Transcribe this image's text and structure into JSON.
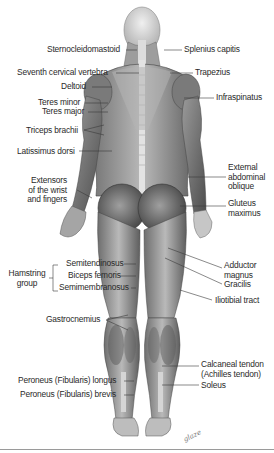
{
  "figure": {
    "view": "posterior",
    "labels_left": [
      {
        "id": "sternocleidomastoid",
        "text": "Sternocleidomastoid",
        "x": 33,
        "y": 46
      },
      {
        "id": "seventh-cervical-vertebra",
        "text": "Seventh cervical vertebra",
        "x": 17,
        "y": 69
      },
      {
        "id": "deltoid",
        "text": "Deltoid",
        "x": 62,
        "y": 83
      },
      {
        "id": "teres-minor",
        "text": "Teres minor",
        "x": 40,
        "y": 99
      },
      {
        "id": "teres-major",
        "text": "Teres major",
        "x": 43,
        "y": 108
      },
      {
        "id": "triceps-brachii",
        "text": "Triceps brachii",
        "x": 26,
        "y": 126
      },
      {
        "id": "latissimus-dorsi",
        "text": "Latissimus dorsi",
        "x": 17,
        "y": 147
      },
      {
        "id": "extensors-wrist-fingers",
        "text": "Extensors\nof the wrist\nand fingers",
        "x": 30,
        "y": 178
      },
      {
        "id": "semitendinosus",
        "text": "Semitendinosus",
        "x": 66,
        "y": 260
      },
      {
        "id": "biceps-femoris",
        "text": "Biceps femoris",
        "x": 68,
        "y": 272
      },
      {
        "id": "semimembranosus",
        "text": "Semimembranosus",
        "x": 58,
        "y": 284
      },
      {
        "id": "hamstring-group",
        "text": "Hamstring\ngroup",
        "x": 8,
        "y": 270
      },
      {
        "id": "gastrocnemius",
        "text": "Gastrocnemius",
        "x": 46,
        "y": 316
      },
      {
        "id": "peroneus-longus",
        "text": "Peroneus (Fibularis) longus",
        "x": 18,
        "y": 377
      },
      {
        "id": "peroneus-brevis",
        "text": "Peroneus (Fibularis) brevis",
        "x": 20,
        "y": 391
      }
    ],
    "labels_right": [
      {
        "id": "splenius-capitis",
        "text": "Splenius capitis",
        "x": 184,
        "y": 46
      },
      {
        "id": "trapezius",
        "text": "Trapezius",
        "x": 196,
        "y": 69
      },
      {
        "id": "infraspinatus",
        "text": "Infraspinatus",
        "x": 216,
        "y": 94
      },
      {
        "id": "external-abdominal-oblique",
        "text": "External\nabdominal\noblique",
        "x": 228,
        "y": 165
      },
      {
        "id": "gluteus-maximus",
        "text": "Gluteus\nmaximus",
        "x": 228,
        "y": 200
      },
      {
        "id": "adductor-magnus",
        "text": "Adductor\nmagnus",
        "x": 224,
        "y": 262
      },
      {
        "id": "gracilis",
        "text": "Gracilis",
        "x": 224,
        "y": 281
      },
      {
        "id": "iliotibial-tract",
        "text": "Iliotibial tract",
        "x": 216,
        "y": 296
      },
      {
        "id": "calcaneal-tendon",
        "text": "Calcaneal tendon\n(Achilles tendon)",
        "x": 201,
        "y": 361
      },
      {
        "id": "soleus",
        "text": "Soleus",
        "x": 201,
        "y": 382
      }
    ],
    "signature": "glaze",
    "colors": {
      "background": "#ffffff",
      "text": "#2a2a2a",
      "leader_line": "#3a3a3a",
      "muscle_dark": "#4a4a4a",
      "muscle_mid": "#8c8c8c",
      "muscle_light": "#c9c9c9",
      "rule": "#9a9a9a"
    }
  }
}
